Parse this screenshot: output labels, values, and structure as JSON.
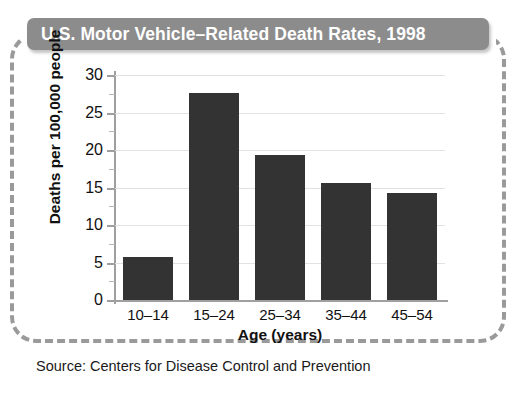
{
  "title": {
    "text": "U.S. Motor Vehicle–Related Death Rates, 1998",
    "background_color": "#8c8c8c",
    "text_color": "#ffffff"
  },
  "source": {
    "text": "Source: Centers for Disease Control and Prevention"
  },
  "frame": {
    "style": "dashed-rounded",
    "color": "#9a9a9a"
  },
  "chart_data": {
    "type": "bar",
    "title": "U.S. Motor Vehicle–Related Death Rates, 1998",
    "categories": [
      "10–14",
      "15–24",
      "25–34",
      "35–44",
      "45–54"
    ],
    "values": [
      5.7,
      27.6,
      19.3,
      15.6,
      14.3
    ],
    "xlabel": "Age (years)",
    "ylabel": "Deaths per 100,000 people",
    "ylim": [
      0,
      30
    ],
    "yticks": [
      0,
      5,
      10,
      15,
      20,
      25,
      30
    ],
    "ytick_labels": [
      "0",
      "5",
      "10",
      "15",
      "20",
      "25",
      "30"
    ],
    "minor_tick_interval": 2.5,
    "grid": "horizontal",
    "grid_color": "#e2e2e2",
    "bar_color": "#333333",
    "axis_color": "#9f9f9f",
    "legend": null
  }
}
